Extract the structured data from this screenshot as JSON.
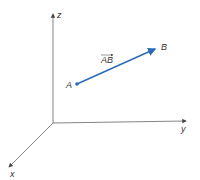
{
  "diagram": {
    "title": "",
    "axes": {
      "z_label": "z",
      "y_label": "y",
      "x_label": "x",
      "color": "#555555"
    },
    "points": {
      "a_label": "A",
      "b_label": "B"
    },
    "vector": {
      "label": "AB",
      "color": "#2a6bb8"
    }
  }
}
